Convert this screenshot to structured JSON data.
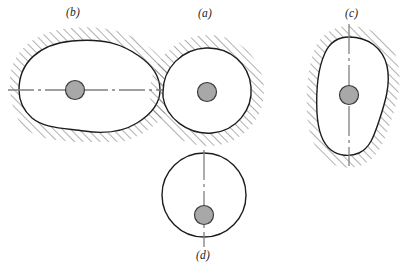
{
  "figure": {
    "background_color": "#ffffff",
    "outline_color": "#1c1c1c",
    "hatch_color": "#6e6e6e",
    "hub_fill_color": "#a8a8a8",
    "hub_stroke_color": "#3a3a3a",
    "centerline_color": "#808080"
  },
  "panels": [
    {
      "id": "b",
      "label": "(b)",
      "label_x": 66,
      "label_y": 6,
      "shape": "horizontal-egg",
      "centerline": "horizontal",
      "hatched": true,
      "hub_offset": "center",
      "hub_cx": 75,
      "hub_cy": 90,
      "hub_r": 9.5
    },
    {
      "id": "a",
      "label": "(a)",
      "label_x": 198,
      "label_y": 7,
      "shape": "circle",
      "centerline": "none",
      "hatched": true,
      "hub_offset": "center",
      "hub_cx": 207,
      "hub_cy": 92,
      "hub_r": 9.5
    },
    {
      "id": "c",
      "label": "(c)",
      "label_x": 345,
      "label_y": 7,
      "shape": "vertical-pear",
      "centerline": "vertical",
      "hatched": true,
      "hub_offset": "center",
      "hub_cx": 349,
      "hub_cy": 95,
      "hub_r": 9.5
    },
    {
      "id": "d",
      "label": "(d)",
      "label_x": 196,
      "label_y": 249,
      "shape": "circle",
      "centerline": "vertical",
      "hatched": false,
      "hub_offset": "below-center",
      "hub_cx": 204,
      "hub_cy": 215,
      "hub_r": 9.5
    }
  ],
  "icons": {
    "hatch": "diagonal-hatch-icon",
    "hub": "shaft-hub-icon",
    "centerline": "center-axis-icon"
  }
}
